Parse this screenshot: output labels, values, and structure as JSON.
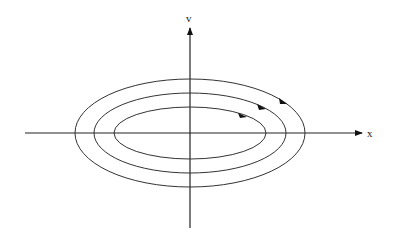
{
  "diagram": {
    "type": "phase-portrait",
    "axes": {
      "horizontal_label": "x",
      "vertical_label": "v"
    },
    "orbits": [
      {
        "name": "inner",
        "direction": "clockwise"
      },
      {
        "name": "middle",
        "direction": "clockwise"
      },
      {
        "name": "outer",
        "direction": "clockwise"
      }
    ],
    "colors": {
      "stroke": "#222222",
      "background": "#ffffff"
    }
  }
}
